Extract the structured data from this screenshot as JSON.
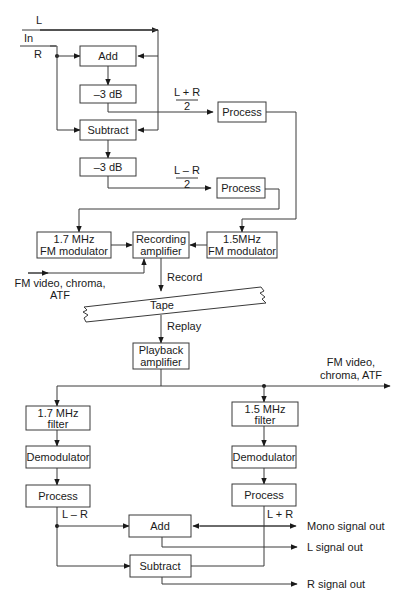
{
  "diagram": {
    "input": {
      "L": "L",
      "in": "In",
      "R": "R"
    },
    "encoder": {
      "add": "Add",
      "att1": "–3 dB",
      "subtract": "Subtract",
      "att2": "–3 dB",
      "sum_num": "L + R",
      "sum_den": "2",
      "diff_num": "L – R",
      "diff_den": "2",
      "process1": "Process",
      "process2": "Process",
      "mod17_l1": "1.7 MHz",
      "mod17_l2": "FM modulator",
      "rec_l1": "Recording",
      "rec_l2": "amplifier",
      "mod15_l1": "1.5MHz",
      "mod15_l2": "FM modulator",
      "fmvideo_l1": "FM video, chroma,",
      "fmvideo_l2": "ATF"
    },
    "tape": {
      "record": "Record",
      "tape": "Tape",
      "replay": "Replay"
    },
    "decoder": {
      "play_l1": "Playback",
      "play_l2": "amplifier",
      "fmout_l1": "FM video,",
      "fmout_l2": "chroma, ATF",
      "filt17_l1": "1.7 MHz",
      "filt17_l2": "filter",
      "filt15_l1": "1.5 MHz",
      "filt15_l2": "filter",
      "demod1": "Demodulator",
      "demod2": "Demodulator",
      "process3": "Process",
      "process4": "Process",
      "lmr": "L – R",
      "lpr": "L + R",
      "add": "Add",
      "subtract": "Subtract",
      "mono_out": "Mono signal out",
      "l_out": "L signal out",
      "r_out": "R signal out"
    }
  }
}
